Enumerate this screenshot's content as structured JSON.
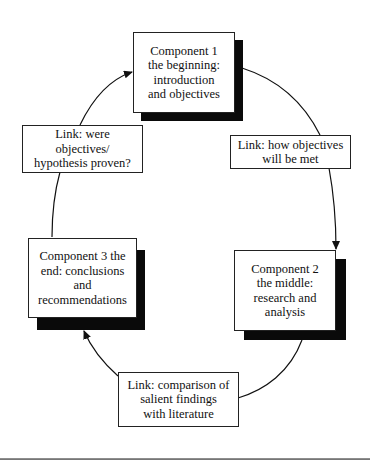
{
  "diagram": {
    "type": "cycle",
    "components": [
      {
        "id": "c1",
        "text": "Component 1\nthe beginning:\nintroduction\nand objectives"
      },
      {
        "id": "c2",
        "text": "Component 2\nthe middle:\nresearch and\nanalysis"
      },
      {
        "id": "c3",
        "text": "Component 3 the\nend: conclusions\nand\nrecommendations"
      }
    ],
    "links": [
      {
        "id": "l12",
        "from": "c1",
        "to": "c2",
        "text": "Link: how objectives\nwill be met"
      },
      {
        "id": "l23",
        "from": "c2",
        "to": "c3",
        "text": "Link: comparison of\nsalient findings\nwith literature"
      },
      {
        "id": "l31",
        "from": "c3",
        "to": "c1",
        "text": "Link: were\nobjectives/\nhypothesis proven?"
      }
    ],
    "colors": {
      "line": "#111111",
      "shadow": "#0a0a0a",
      "box_fill": "#ffffff"
    }
  }
}
